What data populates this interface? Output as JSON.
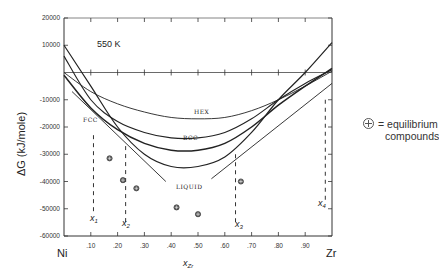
{
  "chart_data": {
    "type": "line",
    "title": "550 K",
    "xlabel": "x_Zr",
    "ylabel": "ΔG (kJ/mole)",
    "x_end_labels": {
      "left": "Ni",
      "right": "Zr"
    },
    "xlim": [
      0,
      1
    ],
    "ylim": [
      -60000,
      20000
    ],
    "x_ticks": [
      ".10",
      ".20",
      ".30",
      ".40",
      ".50",
      ".60",
      ".70",
      ".80",
      ".90"
    ],
    "y_ticks": [
      "20000",
      "10000",
      "-10000",
      "-20000",
      "-30000",
      "-40000",
      "-50000",
      "-60000"
    ],
    "series": [
      {
        "name": "HEX",
        "x": [
          0,
          0.1,
          0.2,
          0.3,
          0.4,
          0.5,
          0.6,
          0.7,
          0.8,
          0.9,
          1.0
        ],
        "y": [
          0,
          -7000,
          -11500,
          -14500,
          -16500,
          -17000,
          -16500,
          -14000,
          -10000,
          -5000,
          500
        ]
      },
      {
        "name": "BCC",
        "x": [
          0,
          0.1,
          0.2,
          0.3,
          0.4,
          0.5,
          0.6,
          0.7,
          0.8,
          0.9,
          1.0
        ],
        "y": [
          6000,
          -10000,
          -18000,
          -22000,
          -24000,
          -24000,
          -22000,
          -17000,
          -10000,
          -4000,
          1000
        ]
      },
      {
        "name": "FCC",
        "x": [
          0,
          0.1,
          0.2,
          0.3,
          0.4,
          0.5,
          0.6,
          0.7,
          0.8,
          0.9,
          1.0
        ],
        "y": [
          -1000,
          -13000,
          -21000,
          -26000,
          -28500,
          -28500,
          -26000,
          -20000,
          -12000,
          -5000,
          1500
        ]
      },
      {
        "name": "LIQUID",
        "x": [
          0,
          0.1,
          0.2,
          0.3,
          0.4,
          0.5,
          0.6,
          0.7,
          0.8,
          0.9,
          1.0
        ],
        "y": [
          10000,
          -5000,
          -20000,
          -30000,
          -34500,
          -34500,
          -31000,
          -22000,
          -10000,
          0,
          11000
        ]
      }
    ],
    "tangent_lines": [
      {
        "from": [
          0.03,
          -7000
        ],
        "to": [
          0.38,
          -40000
        ]
      },
      {
        "from": [
          0.55,
          -39000
        ],
        "to": [
          1.0,
          -4000
        ]
      }
    ],
    "equilibrium_compounds": [
      {
        "x": 0.17,
        "y": -31500
      },
      {
        "x": 0.22,
        "y": -39500
      },
      {
        "x": 0.27,
        "y": -42500
      },
      {
        "x": 0.42,
        "y": -49500
      },
      {
        "x": 0.5,
        "y": -52000
      },
      {
        "x": 0.66,
        "y": -40000
      }
    ],
    "composition_markers": [
      {
        "label": "x1",
        "x": 0.11
      },
      {
        "label": "x2",
        "x": 0.23
      },
      {
        "label": "x3",
        "x": 0.64
      },
      {
        "label": "x4",
        "x": 0.975
      }
    ],
    "legend": {
      "symbol": "⊕",
      "text_line1": "= equilibrium",
      "text_line2": "compounds",
      "position": "right"
    },
    "grid": false
  },
  "labels": {
    "temperature": "550 K",
    "ylabel": "ΔG (kJ/mole)",
    "xlabel_main": "x",
    "xlabel_sub": "Zr",
    "left_element": "Ni",
    "right_element": "Zr",
    "hex": "HEX",
    "bcc": "BCC",
    "fcc": "FCC",
    "liquid": "LIQUID",
    "x1": "x",
    "x2": "x",
    "x3": "x",
    "x4": "x",
    "x1_sub": "1",
    "x2_sub": "2",
    "x3_sub": "3",
    "x4_sub": "4",
    "legend_line1": "= equilibrium",
    "legend_line2": "compounds"
  }
}
